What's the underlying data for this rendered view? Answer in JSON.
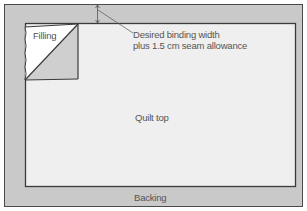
{
  "diagram": {
    "colors": {
      "backing": "#c9c9c9",
      "quilt_top": "#efefef",
      "filling_white": "#ffffff",
      "filling_gray": "#cfcfcf",
      "outline": "#4a4a4a",
      "text": "#555555"
    },
    "labels": {
      "filling": "Filling",
      "annotation_line1": "Desired binding width",
      "annotation_line2": "plus 1.5 cm seam allowance",
      "quilt_top": "Quilt top",
      "backing": "Backing"
    }
  }
}
